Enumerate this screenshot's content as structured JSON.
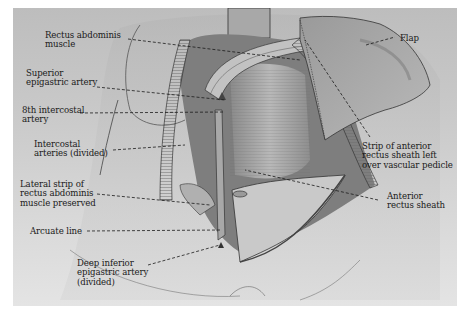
{
  "figure": {
    "colors": {
      "background": "#ffffff",
      "panel_top": "#bdbdbd",
      "panel_bottom": "#e4e4e4",
      "ink": "#1a1a1a"
    }
  },
  "labels": {
    "rectus_abdominis": "Rectus abdominis\nmuscle",
    "superior_epigastric": "Superior\nepigastric artery",
    "eighth_intercostal": "8th intercostal\nartery",
    "intercostal_divided": "Intercostal\narteries (divided)",
    "lateral_strip": "Lateral strip of\nrectus abdominis\nmuscle preserved",
    "arcuate_line": "Arcuate line",
    "deep_inferior": "Deep inferior\nepigastric artery\n(divided)",
    "flap": "Flap",
    "strip_anterior": "Strip of anterior\nrectus sheath left\nover vascular pedicle",
    "anterior_sheath": "Anterior\nrectus sheath"
  }
}
